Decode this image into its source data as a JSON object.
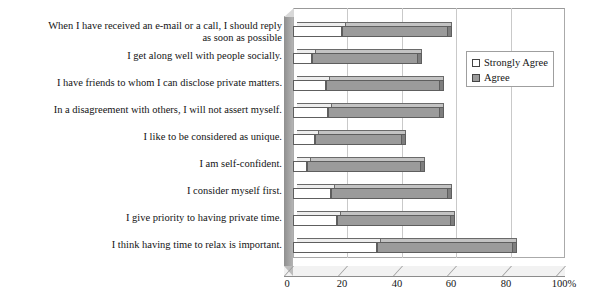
{
  "chart_data": {
    "type": "bar",
    "orientation": "horizontal",
    "stacked": true,
    "title": "",
    "xlabel": "",
    "ylabel": "",
    "xlim": [
      0,
      100
    ],
    "xticks": [
      "0",
      "20",
      "40",
      "60",
      "80",
      "100%"
    ],
    "xtick_values": [
      0,
      20,
      40,
      60,
      80,
      100
    ],
    "grid": true,
    "legend_position": "upper right",
    "categories": [
      "When I have received an e-mail or a call, I should reply\nas soon as possible",
      "I get along well with people socially.",
      "I have friends to whom I can disclose private matters.",
      "In a disagreement with others, I will not assert myself.",
      "I like to be considered as unique.",
      "I am self-confident.",
      "I consider myself first.",
      "I give priority to having private time.",
      "I think having time to relax is important."
    ],
    "series": [
      {
        "name": "Strongly Agree",
        "color": "#ffffff",
        "values": [
          18,
          7,
          12,
          13,
          8,
          5,
          14,
          16,
          31
        ]
      },
      {
        "name": "Agree",
        "color": "#9b9b9b",
        "values": [
          39,
          39,
          42,
          41,
          32,
          42,
          43,
          42,
          50
        ]
      }
    ],
    "totals": [
      57,
      46,
      54,
      54,
      40,
      47,
      57,
      58,
      81
    ]
  },
  "legend": {
    "items": [
      {
        "label": "Strongly Agree",
        "swatch": "white-square-icon"
      },
      {
        "label": "Agree",
        "swatch": "gray-square-icon"
      }
    ]
  }
}
